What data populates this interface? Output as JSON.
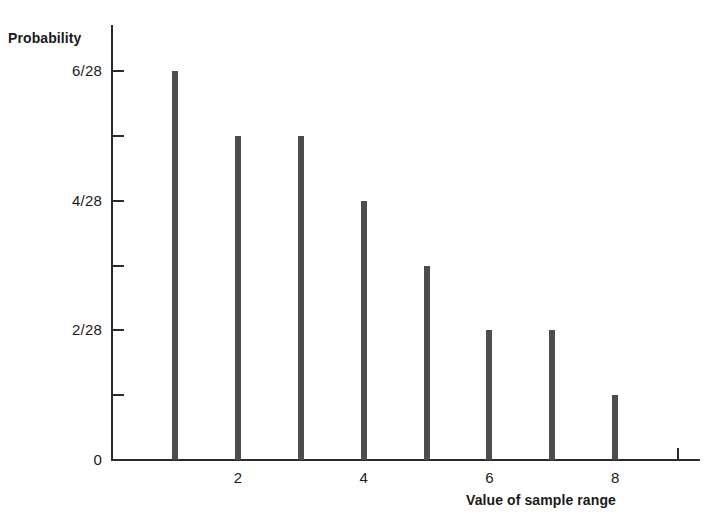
{
  "chart_data": {
    "type": "bar",
    "title": "",
    "xlabel": "Value of sample range",
    "ylabel": "Probability",
    "categories": [
      "1",
      "2",
      "3",
      "4",
      "5",
      "6",
      "7",
      "8"
    ],
    "values": [
      6,
      5,
      5,
      4,
      3,
      2,
      2,
      1
    ],
    "value_labels": [
      "6/28",
      "5/28",
      "5/28",
      "4/28",
      "3/28",
      "2/28",
      "2/28",
      "1/28"
    ],
    "value_denominator": 28,
    "xlim": [
      0,
      9.35
    ],
    "ylim": [
      0,
      6.7
    ],
    "grid": false,
    "legend": null,
    "x_ticks": [
      1,
      2,
      3,
      4,
      5,
      6,
      7,
      8,
      9
    ],
    "x_tick_labels": [
      "",
      "2",
      "",
      "4",
      "",
      "6",
      "",
      "8",
      ""
    ],
    "y_ticks": [
      0,
      1,
      2,
      3,
      4,
      5,
      6
    ],
    "y_tick_labels": [
      "0",
      "",
      "2/28",
      "",
      "4/28",
      "",
      "6/28"
    ],
    "bar_color": "#4d4d4d",
    "axis_color": "#2b2b2b",
    "background_color": "#ffffff"
  }
}
